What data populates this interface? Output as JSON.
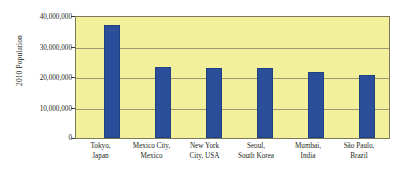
{
  "chart_data": {
    "type": "bar",
    "title": "",
    "subtitle": "",
    "xlabel": "",
    "ylabel": "2010 Population",
    "categories": [
      "Tokyo, Japan",
      "Mexico City, Mexico",
      "New York City, USA",
      "Seoul, South Korea",
      "Mumbai, India",
      "São Paulo, Brazil"
    ],
    "category_lines": [
      [
        "Tokyo,",
        "Japan"
      ],
      [
        "Mexico City,",
        "Mexico"
      ],
      [
        "New York",
        "City, USA"
      ],
      [
        "Seoul,",
        "South Korea"
      ],
      [
        "Mumbai,",
        "India"
      ],
      [
        "São Paulo,",
        "Brazil"
      ]
    ],
    "values": [
      37500000,
      23500000,
      23300000,
      23000000,
      21900000,
      20800000
    ],
    "ylim": [
      0,
      40000000
    ],
    "ytick_values": [
      0,
      10000000,
      20000000,
      30000000,
      40000000
    ],
    "ytick_labels": [
      "0",
      "10,000,000",
      "20,000,000",
      "30,000,000",
      "40,000,000"
    ],
    "grid": true,
    "legend": false,
    "legend_position": "none",
    "colors": {
      "bar": "#2b4e9b",
      "bar_border": "#21407f",
      "plot_background": "#f2f09a",
      "plot_border": "#7a7a5a",
      "gridline": "#9a9a72",
      "text": "#231f20",
      "page_background": "#ffffff"
    }
  }
}
